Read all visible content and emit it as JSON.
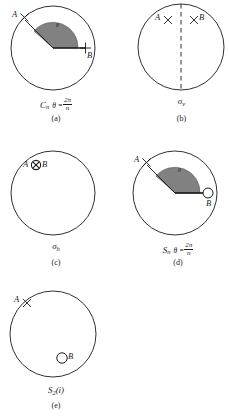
{
  "figure": {
    "stroke_color": "#1a1a1a",
    "sector_fill": "#6b6b6b"
  },
  "panels": [
    {
      "id": "a",
      "letter": "(a)",
      "caption_symbol": "C",
      "caption_sub": "n",
      "condition_theta": "θ =",
      "condition_num": "2π",
      "condition_den": "n",
      "label_a": "A",
      "marker_a": "cross-x",
      "label_b": "B",
      "marker_b": "plus",
      "angle_label": "θ",
      "sector": true,
      "dashed_mirror": false
    },
    {
      "id": "b",
      "letter": "(b)",
      "caption_symbol": "σ",
      "caption_sub": "v",
      "condition_theta": "",
      "condition_num": "",
      "condition_den": "",
      "label_a": "A",
      "marker_a": "cross-x",
      "label_b": "B",
      "marker_b": "cross-x",
      "angle_label": "",
      "sector": false,
      "dashed_mirror": true
    },
    {
      "id": "c",
      "letter": "(c)",
      "caption_symbol": "σ",
      "caption_sub": "h",
      "condition_theta": "",
      "condition_num": "",
      "condition_den": "",
      "label_a": "A",
      "marker_a": "circled-x",
      "label_b": "B",
      "marker_b": "circled-x",
      "angle_label": "",
      "sector": false,
      "dashed_mirror": false
    },
    {
      "id": "d",
      "letter": "(d)",
      "caption_symbol": "S",
      "caption_sub": "n",
      "condition_theta": "θ =",
      "condition_num": "2π",
      "condition_den": "n",
      "label_a": "A",
      "marker_a": "cross-x",
      "label_b": "B",
      "marker_b": "open-circle",
      "angle_label": "θ",
      "sector": true,
      "dashed_mirror": false
    },
    {
      "id": "e",
      "letter": "(e)",
      "caption_symbol": "S",
      "caption_sub": "2",
      "condition_theta": "(i)",
      "condition_num": "",
      "condition_den": "",
      "label_a": "A",
      "marker_a": "cross-x",
      "label_b": "B",
      "marker_b": "open-circle",
      "angle_label": "",
      "sector": false,
      "dashed_mirror": false
    }
  ]
}
